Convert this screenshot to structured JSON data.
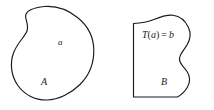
{
  "figure": {
    "background_color": "#ffffff",
    "stroke_color": "#1a1a1a",
    "width": 214,
    "height": 110,
    "caption": ""
  },
  "left_region": {
    "set_label": "A",
    "point_label": "a",
    "shape": "closed-blob"
  },
  "right_region": {
    "set_label": "B",
    "mapping_label": "T(a) = b",
    "mapping_parts": {
      "function": "T",
      "open_paren": "(",
      "argument": "a",
      "close_paren": ")",
      "equals": "=",
      "result": "b"
    },
    "shape": "open-region-wavy-right-edge"
  }
}
